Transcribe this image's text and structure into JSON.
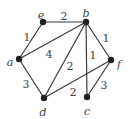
{
  "graph": {
    "nodes": [
      {
        "id": "e",
        "label": "e",
        "x": 43,
        "y": 22,
        "lx": 41,
        "ly": 15
      },
      {
        "id": "b",
        "label": "b",
        "x": 86,
        "y": 22,
        "lx": 86,
        "ly": 13
      },
      {
        "id": "a",
        "label": "a",
        "x": 19,
        "y": 59,
        "lx": 10,
        "ly": 62
      },
      {
        "id": "f",
        "label": "f",
        "x": 111,
        "y": 60,
        "lx": 119,
        "ly": 64
      },
      {
        "id": "d",
        "label": "d",
        "x": 44,
        "y": 98,
        "lx": 43,
        "ly": 112
      },
      {
        "id": "c",
        "label": "c",
        "x": 87,
        "y": 97,
        "lx": 87,
        "ly": 111
      }
    ],
    "edges": [
      {
        "from": "e",
        "to": "b",
        "weight": "2",
        "lx": 64,
        "ly": 16
      },
      {
        "from": "a",
        "to": "e",
        "weight": "1",
        "lx": 27,
        "ly": 37
      },
      {
        "from": "a",
        "to": "b",
        "weight": "4",
        "lx": 49,
        "ly": 54
      },
      {
        "from": "b",
        "to": "d",
        "weight": "2",
        "lx": 70,
        "ly": 66
      },
      {
        "from": "b",
        "to": "c",
        "weight": "1",
        "lx": 93,
        "ly": 55
      },
      {
        "from": "b",
        "to": "f",
        "weight": "1",
        "lx": 106,
        "ly": 38
      },
      {
        "from": "a",
        "to": "d",
        "weight": "3",
        "lx": 26,
        "ly": 84
      },
      {
        "from": "d",
        "to": "f",
        "weight": "2",
        "lx": 73,
        "ly": 92
      },
      {
        "from": "c",
        "to": "f",
        "weight": "3",
        "lx": 104,
        "ly": 85
      }
    ]
  }
}
